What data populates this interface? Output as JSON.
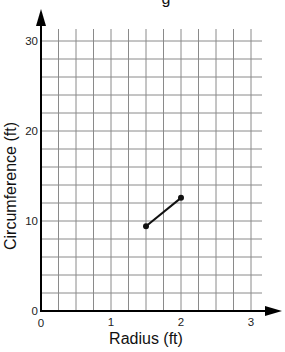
{
  "chart_data": {
    "type": "line",
    "title": "",
    "title_fragment_visible": "g",
    "xlabel": "Radius (ft)",
    "ylabel": "Circumference (ft)",
    "xlim": [
      0,
      3.15
    ],
    "ylim": [
      0,
      31
    ],
    "x_ticks": [
      0,
      1,
      2,
      3
    ],
    "x_tick_labels": [
      "0",
      "1",
      "2",
      "3"
    ],
    "y_ticks": [
      0,
      10,
      20,
      30
    ],
    "y_tick_labels": [
      "0",
      "10",
      "20",
      "30"
    ],
    "x_grid_step": 0.25,
    "y_grid_step": 2,
    "grid": true,
    "legend": null,
    "series": [
      {
        "name": "Circumference vs Radius",
        "x": [
          1.5,
          2
        ],
        "y": [
          9.42,
          12.57
        ],
        "color": "#111111",
        "markers": true
      }
    ]
  },
  "colors": {
    "grid": "#8a8a8a",
    "axis": "#000000",
    "line": "#111111"
  }
}
